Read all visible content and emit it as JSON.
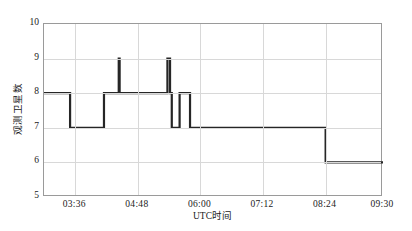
{
  "chart_data": {
    "type": "line",
    "title": "",
    "subtitle": "",
    "xlabel": "UTC时间",
    "ylabel": "观测卫星数",
    "xtick_labels": [
      "03:36",
      "04:48",
      "06:00",
      "07:12",
      "08:24",
      "09:30"
    ],
    "ytick_labels": [
      "5",
      "6",
      "7",
      "8",
      "9",
      "10"
    ],
    "ylim": [
      5,
      10
    ],
    "xlim": [
      "03:00",
      "09:30"
    ],
    "grid": true,
    "legend": "none",
    "series": [
      {
        "name": "观测卫星数",
        "color": "#262626",
        "style": "step-post",
        "points": [
          {
            "x": "03:00",
            "y": 8
          },
          {
            "x": "03:30",
            "y": 8
          },
          {
            "x": "03:30",
            "y": 7
          },
          {
            "x": "04:09",
            "y": 7
          },
          {
            "x": "04:09",
            "y": 8
          },
          {
            "x": "04:26",
            "y": 8
          },
          {
            "x": "04:26",
            "y": 9
          },
          {
            "x": "04:27",
            "y": 9
          },
          {
            "x": "04:27",
            "y": 8
          },
          {
            "x": "05:22",
            "y": 8
          },
          {
            "x": "05:22",
            "y": 9
          },
          {
            "x": "05:25",
            "y": 9
          },
          {
            "x": "05:25",
            "y": 8
          },
          {
            "x": "05:27",
            "y": 8
          },
          {
            "x": "05:27",
            "y": 7
          },
          {
            "x": "05:36",
            "y": 7
          },
          {
            "x": "05:36",
            "y": 8
          },
          {
            "x": "05:48",
            "y": 8
          },
          {
            "x": "05:48",
            "y": 7
          },
          {
            "x": "08:24",
            "y": 7
          },
          {
            "x": "08:24",
            "y": 6
          },
          {
            "x": "09:30",
            "y": 6
          }
        ]
      }
    ],
    "annotations": [
      {
        "label": "spike to 9",
        "x": "04:26",
        "y": 9
      },
      {
        "label": "spike to 9",
        "x": "05:22",
        "y": 9
      },
      {
        "label": "step down to 6",
        "x": "08:24",
        "y": 6
      }
    ]
  },
  "colors": {
    "line": "#262626",
    "frame": "#9a9a9a",
    "grid": "#d8d8d8",
    "text": "#1a1a1a",
    "background": "#ffffff"
  }
}
